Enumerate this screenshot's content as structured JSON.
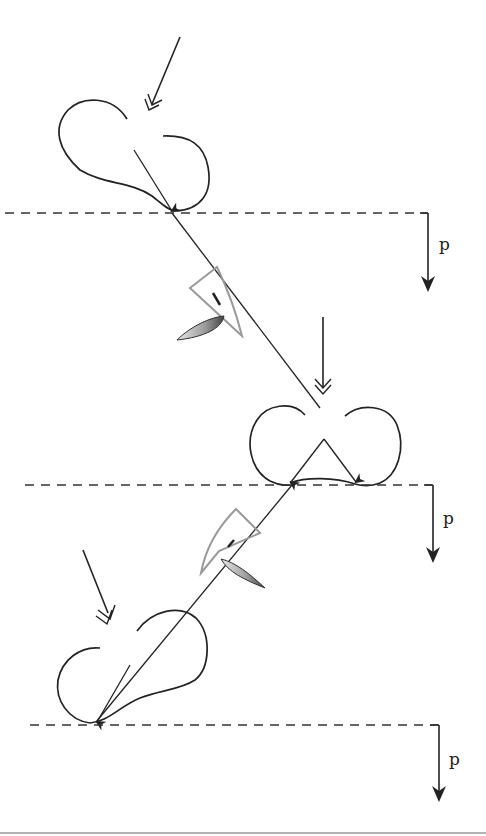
{
  "diagram": {
    "force_label": "p",
    "colors": {
      "ink": "#222222",
      "wedge": "#9a9a9a",
      "crescent_fill_dark": "#555555",
      "crescent_fill_light": "#e6e6e6",
      "bottom_rule": "#999999"
    },
    "stages": [
      {
        "id": "stage-1",
        "surface_y": 212,
        "force_label": "p"
      },
      {
        "id": "stage-2",
        "surface_y": 485,
        "force_label": "p"
      },
      {
        "id": "stage-3",
        "surface_y": 725,
        "force_label": "p"
      }
    ]
  }
}
